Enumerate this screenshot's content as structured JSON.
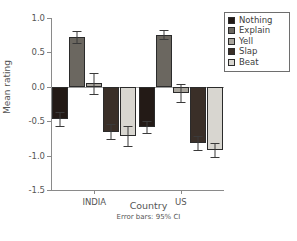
{
  "chart_data": {
    "type": "bar",
    "title": "",
    "subtitle": "",
    "xlabel": "Country",
    "ylabel": "Mean rating",
    "categories": [
      "INDIA",
      "US"
    ],
    "series": [
      {
        "name": "Nothing",
        "color": "#231a16",
        "values": [
          -0.47,
          -0.58
        ],
        "ci_low": [
          -0.57,
          -0.67
        ],
        "ci_high": [
          -0.37,
          -0.49
        ]
      },
      {
        "name": "Explain",
        "color": "#6b6760",
        "values": [
          0.72,
          0.76
        ],
        "ci_low": [
          0.63,
          0.7
        ],
        "ci_high": [
          0.81,
          0.83
        ]
      },
      {
        "name": "Yell",
        "color": "#a8a49c",
        "values": [
          0.05,
          -0.09
        ],
        "ci_low": [
          -0.1,
          -0.22
        ],
        "ci_high": [
          0.2,
          0.04
        ]
      },
      {
        "name": "Slap",
        "color": "#3a2f28",
        "values": [
          -0.65,
          -0.82
        ],
        "ci_low": [
          -0.76,
          -0.92
        ],
        "ci_high": [
          -0.54,
          -0.72
        ]
      },
      {
        "name": "Beat",
        "color": "#d8d6d0",
        "values": [
          -0.71,
          -0.92
        ],
        "ci_low": [
          -0.86,
          -1.02
        ],
        "ci_high": [
          -0.57,
          -0.82
        ]
      }
    ],
    "ylim": [
      -1.5,
      1.0
    ],
    "yticks": [
      1.0,
      0.5,
      0.0,
      -0.5,
      -1.0,
      -1.5
    ],
    "ytick_labels": [
      "1.0",
      "0.5",
      "0.0",
      "-0.5",
      "-1.0",
      "-1.5"
    ],
    "grid": false,
    "legend_position": "top-right",
    "error_bars": "95% CI",
    "annotation": "Error bars: 95% CI"
  },
  "legend": {
    "items": [
      {
        "label": "Nothing"
      },
      {
        "label": "Explain"
      },
      {
        "label": "Yell"
      },
      {
        "label": "Slap"
      },
      {
        "label": "Beat"
      }
    ]
  }
}
